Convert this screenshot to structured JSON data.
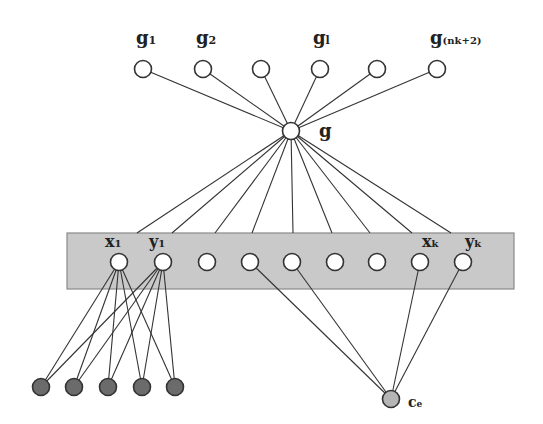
{
  "diagram": {
    "type": "graph",
    "colors": {
      "background": "#ffffff",
      "box_fill": "#c9c9c9",
      "box_stroke": "#8a8a8a",
      "edge": "#333333",
      "node_open_fill": "#ffffff",
      "node_stroke": "#333333",
      "node_dark_fill": "#6b6b6b",
      "node_ce_fill": "#b5b5b5"
    },
    "top_nodes": [
      {
        "id": "g1",
        "x": 143,
        "y": 69,
        "label": "g",
        "sub": "1"
      },
      {
        "id": "g2",
        "x": 203,
        "y": 69,
        "label": "g",
        "sub": "2"
      },
      {
        "id": "g3",
        "x": 261,
        "y": 69,
        "label": "",
        "sub": ""
      },
      {
        "id": "gl",
        "x": 320,
        "y": 69,
        "label": "g",
        "sub": "l"
      },
      {
        "id": "g5",
        "x": 377,
        "y": 69,
        "label": "",
        "sub": ""
      },
      {
        "id": "g_nk2",
        "x": 437,
        "y": 69,
        "label": "g",
        "sub": "(nk+2)"
      }
    ],
    "center_node": {
      "id": "g",
      "x": 291,
      "y": 131,
      "label": "g"
    },
    "box": {
      "x": 67,
      "y": 233,
      "width": 447,
      "height": 56
    },
    "box_nodes": [
      {
        "id": "x1",
        "x": 119,
        "y": 262,
        "label": "x",
        "sub": "1",
        "top_x": 137
      },
      {
        "id": "y1",
        "x": 163,
        "y": 262,
        "label": "y",
        "sub": "1",
        "top_x": 172
      },
      {
        "id": "n3",
        "x": 207,
        "y": 262,
        "label": "",
        "sub": "",
        "top_x": 215
      },
      {
        "id": "n4",
        "x": 250,
        "y": 262,
        "label": "",
        "sub": "",
        "top_x": 252
      },
      {
        "id": "n5",
        "x": 292,
        "y": 262,
        "label": "",
        "sub": "",
        "top_x": 293
      },
      {
        "id": "n6",
        "x": 335,
        "y": 262,
        "label": "",
        "sub": "",
        "top_x": 332
      },
      {
        "id": "n7",
        "x": 377,
        "y": 262,
        "label": "",
        "sub": "",
        "top_x": 370
      },
      {
        "id": "xk",
        "x": 420,
        "y": 262,
        "label": "x",
        "sub": "k",
        "top_x": 412
      },
      {
        "id": "yk",
        "x": 463,
        "y": 262,
        "label": "y",
        "sub": "k",
        "top_x": 451
      }
    ],
    "dark_nodes": [
      {
        "id": "d1",
        "x": 41,
        "y": 387
      },
      {
        "id": "d2",
        "x": 74,
        "y": 387
      },
      {
        "id": "d3",
        "x": 108,
        "y": 387
      },
      {
        "id": "d4",
        "x": 142,
        "y": 387
      },
      {
        "id": "d5",
        "x": 175,
        "y": 387
      }
    ],
    "ce_node": {
      "id": "ce",
      "x": 391,
      "y": 399,
      "label": "c",
      "sub": "e"
    },
    "edges_x1_to_dark": [
      "d1",
      "d2",
      "d3",
      "d4",
      "d5"
    ],
    "edges_y1_to_dark": [
      "d1",
      "d2",
      "d3",
      "d4",
      "d5"
    ],
    "edges_to_ce": [
      "n4",
      "n5",
      "xk",
      "yk"
    ]
  }
}
